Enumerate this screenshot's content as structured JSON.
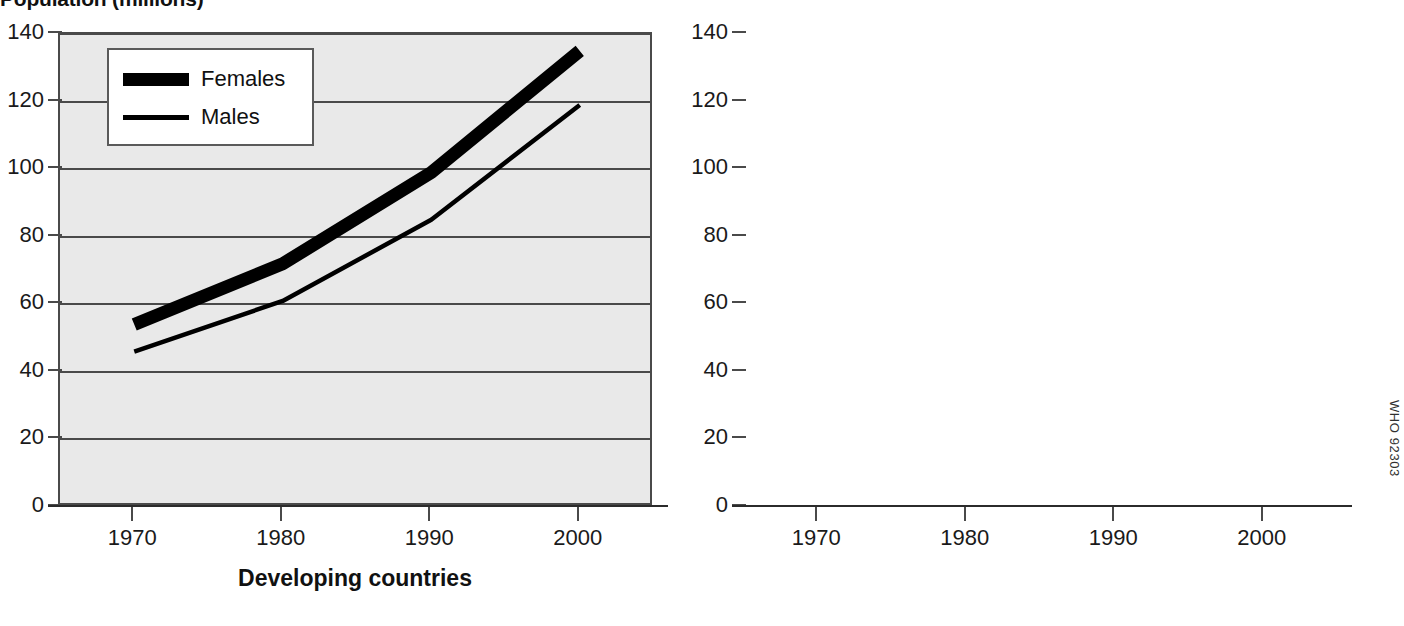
{
  "title": "Population (millions)",
  "credit": "WHO 92303",
  "legend": {
    "items": [
      {
        "label": "Females",
        "style": "thick"
      },
      {
        "label": "Males",
        "style": "thin"
      }
    ]
  },
  "axis": {
    "y_ticks": [
      "0",
      "20",
      "40",
      "60",
      "80",
      "100",
      "120",
      "140"
    ],
    "x_ticks": [
      "1970",
      "1980",
      "1990",
      "2000"
    ]
  },
  "panels": {
    "left": {
      "caption": "Developing countries"
    },
    "right": {
      "caption": "Developed countries"
    }
  },
  "colors": {
    "plot_background": "#e9e9e9",
    "axis": "#4a4a4a",
    "series": "#000000",
    "page_background": "#ffffff"
  },
  "chart_data": [
    {
      "type": "line",
      "title": "Developing countries",
      "subtitle": "Population (millions)",
      "xlabel": "",
      "ylabel": "Population (millions)",
      "x": [
        1970,
        1980,
        1990,
        2000
      ],
      "xlim": [
        1965,
        2005
      ],
      "ylim": [
        0,
        140
      ],
      "ytick_values": [
        0,
        20,
        40,
        60,
        80,
        100,
        120,
        140
      ],
      "xtick_values": [
        1970,
        1980,
        1990,
        2000
      ],
      "grid": "horizontal",
      "legend_position": "top-left",
      "series": [
        {
          "name": "Females",
          "values": [
            54,
            72,
            99,
            135
          ],
          "line_width": "thick"
        },
        {
          "name": "Males",
          "values": [
            46,
            61,
            85,
            119
          ],
          "line_width": "thin"
        }
      ]
    },
    {
      "type": "line",
      "title": "Developed countries",
      "subtitle": "Population (millions)",
      "xlabel": "",
      "ylabel": "Population (millions)",
      "x": [
        1970,
        1980,
        1990,
        2000
      ],
      "xlim": [
        1965,
        2005
      ],
      "ylim": [
        0,
        140
      ],
      "ytick_values": [
        0,
        20,
        40,
        60,
        80,
        100,
        120,
        140
      ],
      "xtick_values": [
        1970,
        1980,
        1990,
        2000
      ],
      "grid": "horizontal",
      "legend_position": "none",
      "series": [
        {
          "name": "Females",
          "values": [
            61,
            81.5,
            92,
            106.5
          ],
          "line_width": "thick"
        },
        {
          "name": "Males",
          "values": [
            40.5,
            50.5,
            55,
            68.5
          ],
          "line_width": "thin"
        }
      ]
    }
  ]
}
